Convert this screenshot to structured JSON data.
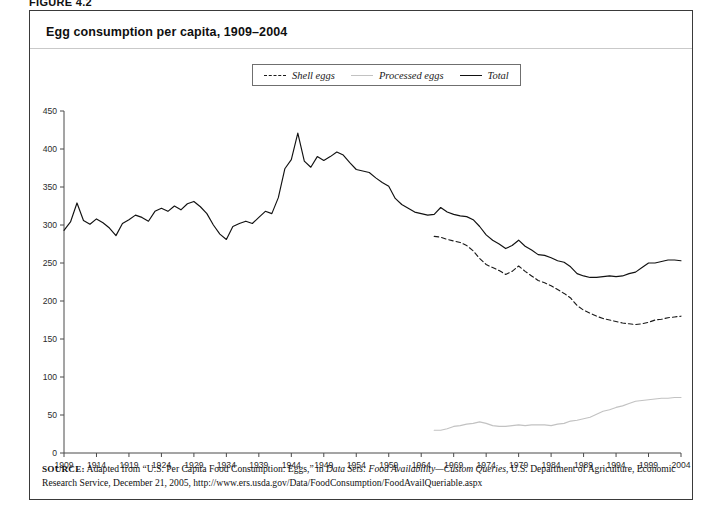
{
  "figure": {
    "label": "FIGURE 4.2",
    "title": "Egg consumption per capita, 1909–2004"
  },
  "legend": {
    "items": [
      {
        "label": "Shell eggs",
        "style": "dashed",
        "color": "#1a1a1a"
      },
      {
        "label": "Processed eggs",
        "style": "light-solid",
        "color": "#c2c2c2"
      },
      {
        "label": "Total",
        "style": "solid",
        "color": "#111111"
      }
    ]
  },
  "source": {
    "label": "SOURCE:",
    "line1_a": " Adapted from “U.S. Per Capita Food Consumption: Eggs,” in ",
    "line1_italic": "Data Sets: Food Availability—Custom Queries",
    "line1_b": ", U.S. Department of Agriculture,",
    "line2": "Economic Research Service, December 21, 2005, http://www.ers.usda.gov/Data/FoodConsumption/FoodAvailQueriable.aspx"
  },
  "chart_data": {
    "type": "line",
    "title": "Egg consumption per capita, 1909–2004",
    "xlabel": "",
    "ylabel": "",
    "xlim": [
      1909,
      2004
    ],
    "ylim": [
      0,
      450
    ],
    "ytick_step": 50,
    "yticks": [
      0,
      50,
      100,
      150,
      200,
      250,
      300,
      350,
      400,
      450
    ],
    "xticks": [
      1909,
      1914,
      1919,
      1924,
      1929,
      1934,
      1939,
      1944,
      1949,
      1954,
      1959,
      1964,
      1969,
      1974,
      1979,
      1984,
      1989,
      1994,
      1999,
      2004
    ],
    "grid": false,
    "legend_position": "top-center",
    "series": [
      {
        "name": "Total",
        "color": "#111111",
        "style": "solid",
        "x": [
          1909,
          1910,
          1911,
          1912,
          1913,
          1914,
          1915,
          1916,
          1917,
          1918,
          1919,
          1920,
          1921,
          1922,
          1923,
          1924,
          1925,
          1926,
          1927,
          1928,
          1929,
          1930,
          1931,
          1932,
          1933,
          1934,
          1935,
          1936,
          1937,
          1938,
          1939,
          1940,
          1941,
          1942,
          1943,
          1944,
          1945,
          1946,
          1947,
          1948,
          1949,
          1950,
          1951,
          1952,
          1953,
          1954,
          1955,
          1956,
          1957,
          1958,
          1959,
          1960,
          1961,
          1962,
          1963,
          1964,
          1965,
          1966,
          1967,
          1968,
          1969,
          1970,
          1971,
          1972,
          1973,
          1974,
          1975,
          1976,
          1977,
          1978,
          1979,
          1980,
          1981,
          1982,
          1983,
          1984,
          1985,
          1986,
          1987,
          1988,
          1989,
          1990,
          1991,
          1992,
          1993,
          1994,
          1995,
          1996,
          1997,
          1998,
          1999,
          2000,
          2001,
          2002,
          2003,
          2004
        ],
        "y": [
          293,
          304,
          329,
          306,
          301,
          308,
          303,
          296,
          286,
          302,
          307,
          313,
          310,
          305,
          318,
          322,
          318,
          325,
          320,
          328,
          331,
          324,
          315,
          300,
          288,
          281,
          298,
          302,
          305,
          302,
          310,
          318,
          315,
          336,
          374,
          386,
          421,
          384,
          376,
          390,
          385,
          390,
          396,
          392,
          382,
          373,
          371,
          369,
          362,
          356,
          351,
          335,
          327,
          322,
          317,
          315,
          313,
          314,
          323,
          317,
          314,
          312,
          311,
          307,
          298,
          287,
          280,
          275,
          269,
          273,
          280,
          272,
          267,
          261,
          260,
          257,
          253,
          251,
          245,
          236,
          233,
          231,
          231,
          232,
          233,
          232,
          233,
          236,
          238,
          244,
          250,
          250,
          252,
          254,
          254,
          253
        ]
      },
      {
        "name": "Shell eggs",
        "color": "#1a1a1a",
        "style": "dashed",
        "x": [
          1966,
          1967,
          1968,
          1969,
          1970,
          1971,
          1972,
          1973,
          1974,
          1975,
          1976,
          1977,
          1978,
          1979,
          1980,
          1981,
          1982,
          1983,
          1984,
          1985,
          1986,
          1987,
          1988,
          1989,
          1990,
          1991,
          1992,
          1993,
          1994,
          1995,
          1996,
          1997,
          1998,
          1999,
          2000,
          2001,
          2002,
          2003,
          2004
        ],
        "y": [
          285,
          284,
          281,
          279,
          277,
          273,
          266,
          256,
          248,
          244,
          240,
          235,
          239,
          246,
          239,
          233,
          227,
          224,
          220,
          215,
          210,
          204,
          194,
          188,
          184,
          180,
          177,
          175,
          173,
          171,
          170,
          169,
          170,
          172,
          175,
          176,
          178,
          179,
          180
        ]
      },
      {
        "name": "Processed eggs",
        "color": "#c2c2c2",
        "style": "solid",
        "x": [
          1966,
          1967,
          1968,
          1969,
          1970,
          1971,
          1972,
          1973,
          1974,
          1975,
          1976,
          1977,
          1978,
          1979,
          1980,
          1981,
          1982,
          1983,
          1984,
          1985,
          1986,
          1987,
          1988,
          1989,
          1990,
          1991,
          1992,
          1993,
          1994,
          1995,
          1996,
          1997,
          1998,
          1999,
          2000,
          2001,
          2002,
          2003,
          2004
        ],
        "y": [
          30,
          30,
          32,
          35,
          36,
          38,
          39,
          41,
          39,
          36,
          35,
          35,
          36,
          37,
          36,
          37,
          37,
          37,
          36,
          38,
          39,
          42,
          43,
          45,
          47,
          51,
          55,
          57,
          60,
          62,
          65,
          68,
          69,
          70,
          71,
          72,
          72,
          73,
          73
        ]
      }
    ]
  }
}
